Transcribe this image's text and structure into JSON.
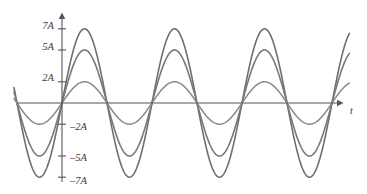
{
  "figure": {
    "title": "",
    "background_color": "#ffffff"
  },
  "axes": {
    "x_axis_label": "t",
    "y_axis_label": "",
    "y_tick_labels": [
      "7A",
      "5A",
      "2A",
      "–2A",
      "–5A",
      "–7A"
    ],
    "y_tick_values": [
      7,
      5,
      2,
      -2,
      -5,
      -7
    ],
    "axis_color": "#555555",
    "label_color": "#3a3a3a"
  },
  "chart_data": {
    "type": "line",
    "title": "",
    "xlabel": "t",
    "ylabel": "",
    "xlim": [
      0,
      3.67
    ],
    "ylim": [
      -8.2,
      8.2
    ],
    "grid": false,
    "legend": false,
    "x_axis_ticks": [],
    "y_axis_ticks": [
      7,
      5,
      2,
      -2,
      -5,
      -7
    ],
    "y_axis_tick_labels": [
      "7A",
      "5A",
      "2A",
      "–2A",
      "–5A",
      "–7A"
    ],
    "series": [
      {
        "name": "amplitude-7A",
        "amplitude": 7,
        "amplitude_label": "7A",
        "period_px": 90,
        "phase": "starts at zero crossing going negative",
        "color": "#6e6e6e",
        "line_width": 1.6
      },
      {
        "name": "amplitude-5A",
        "amplitude": 5,
        "amplitude_label": "5A",
        "period_px": 90,
        "phase": "starts at zero crossing going negative",
        "color": "#787878",
        "line_width": 1.6
      },
      {
        "name": "amplitude-2A",
        "amplitude": 2,
        "amplitude_label": "2A",
        "period_px": 90,
        "phase": "starts at zero crossing going negative",
        "color": "#8a8a8a",
        "line_width": 1.5
      }
    ],
    "peak_positions_px": [
      84,
      174,
      265
    ],
    "trough_positions_px": [
      40,
      129,
      219,
      309
    ],
    "zero_crossings_px": [
      17,
      62,
      107,
      152,
      197,
      242,
      287,
      332
    ]
  },
  "geometry": {
    "x_axis_y_px": 103,
    "y_axis_x_px": 62,
    "x_axis_start_px": 17,
    "x_axis_end_px": 345,
    "y_axis_top_px": 12,
    "y_axis_bottom_px": 182,
    "unit_per_amplitude_px": 10.6,
    "curve_start_px": 14,
    "curve_end_px": 350
  }
}
